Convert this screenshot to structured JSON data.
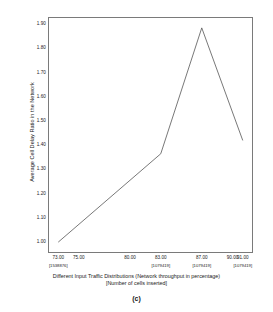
{
  "chart_data": {
    "type": "line",
    "title": "",
    "caption": "(c)",
    "xlabel_line1": "Different Input Traffic Distributions (Network throughput in percentage)",
    "xlabel_line2": "[Number of cells inserted]",
    "ylabel": "Average Cell Delay Ratio in the Network",
    "grid": false,
    "legend": "none",
    "xlim": [
      72.0,
      92.0
    ],
    "ylim": [
      0.955,
      1.93
    ],
    "yticks": [
      "1.00",
      "1.10",
      "1.20",
      "1.30",
      "1.40",
      "1.50",
      "1.60",
      "1.70",
      "1.80",
      "1.90"
    ],
    "ytick_values": [
      1.0,
      1.1,
      1.2,
      1.3,
      1.4,
      1.5,
      1.6,
      1.7,
      1.8,
      1.9
    ],
    "xticks": [
      {
        "label": "73.00",
        "sub": "[1538876]",
        "value": 73.0
      },
      {
        "label": "75.00",
        "sub": "",
        "value": 75.0
      },
      {
        "label": "80.00",
        "sub": "",
        "value": 80.0
      },
      {
        "label": "83.00",
        "sub": "[1079419]",
        "value": 83.0
      },
      {
        "label": "87.00",
        "sub": "[1079419]",
        "value": 87.0
      },
      {
        "label": "90.00",
        "sub": "",
        "value": 90.0
      },
      {
        "label": "91.00",
        "sub": "[1079419]",
        "value": 91.0
      }
    ],
    "x": [
      73.0,
      83.0,
      87.0,
      91.0
    ],
    "values": [
      1.0,
      1.365,
      1.885,
      1.42
    ],
    "series": [
      {
        "name": "Average Cell Delay Ratio",
        "x": [
          73.0,
          83.0,
          87.0,
          91.0
        ],
        "values": [
          1.0,
          1.365,
          1.885,
          1.42
        ],
        "color": "#555555"
      }
    ]
  }
}
